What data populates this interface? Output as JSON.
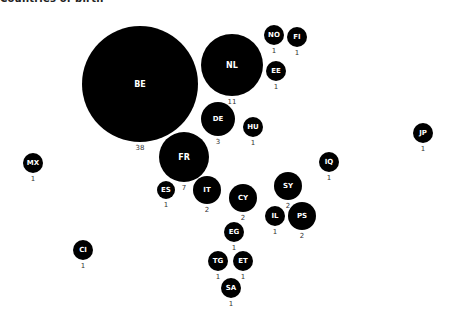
{
  "title": "Countries of birth",
  "colors": {
    "bubble": "#000000",
    "bubble_text": "#ffffff",
    "value_text": "#333333",
    "background": "#ffffff"
  },
  "chart_data": {
    "type": "bubble",
    "title": "Countries of birth",
    "legend": null,
    "bubbles": [
      {
        "code": "BE",
        "value": 38,
        "cx": 140,
        "cy": 84,
        "r": 58
      },
      {
        "code": "NL",
        "value": 11,
        "cx": 232,
        "cy": 65,
        "r": 31
      },
      {
        "code": "NO",
        "value": 1,
        "cx": 274,
        "cy": 35,
        "r": 10
      },
      {
        "code": "FI",
        "value": 1,
        "cx": 297,
        "cy": 37,
        "r": 10
      },
      {
        "code": "EE",
        "value": 1,
        "cx": 276,
        "cy": 71,
        "r": 10
      },
      {
        "code": "DE",
        "value": 3,
        "cx": 218,
        "cy": 119,
        "r": 17
      },
      {
        "code": "HU",
        "value": 1,
        "cx": 253,
        "cy": 127,
        "r": 10
      },
      {
        "code": "FR",
        "value": 7,
        "cx": 184,
        "cy": 157,
        "r": 25
      },
      {
        "code": "ES",
        "value": 1,
        "cx": 166,
        "cy": 190,
        "r": 9
      },
      {
        "code": "IT",
        "value": 2,
        "cx": 207,
        "cy": 190,
        "r": 14
      },
      {
        "code": "CY",
        "value": 2,
        "cx": 243,
        "cy": 198,
        "r": 14
      },
      {
        "code": "SY",
        "value": 2,
        "cx": 288,
        "cy": 186,
        "r": 14
      },
      {
        "code": "IQ",
        "value": 1,
        "cx": 329,
        "cy": 162,
        "r": 10
      },
      {
        "code": "JP",
        "value": 1,
        "cx": 423,
        "cy": 133,
        "r": 10
      },
      {
        "code": "MX",
        "value": 1,
        "cx": 33,
        "cy": 163,
        "r": 10
      },
      {
        "code": "IL",
        "value": 1,
        "cx": 275,
        "cy": 216,
        "r": 10
      },
      {
        "code": "PS",
        "value": 2,
        "cx": 302,
        "cy": 216,
        "r": 14
      },
      {
        "code": "EG",
        "value": 1,
        "cx": 234,
        "cy": 232,
        "r": 10
      },
      {
        "code": "CI",
        "value": 1,
        "cx": 83,
        "cy": 250,
        "r": 10
      },
      {
        "code": "TG",
        "value": 1,
        "cx": 218,
        "cy": 261,
        "r": 10
      },
      {
        "code": "ET",
        "value": 1,
        "cx": 243,
        "cy": 261,
        "r": 10
      },
      {
        "code": "SA",
        "value": 1,
        "cx": 231,
        "cy": 288,
        "r": 10
      }
    ]
  }
}
